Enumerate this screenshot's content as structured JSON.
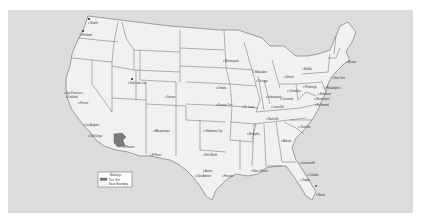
{
  "map": {
    "title": "",
    "colors": {
      "ocean": "#dcdcdc",
      "land": "#f1f1f1",
      "border": "#6a6a6a",
      "highlight": "#7a7a7a"
    },
    "cities": [
      {
        "name": "Seattle",
        "x": 90,
        "y": 24
      },
      {
        "name": "Portland",
        "x": 82,
        "y": 36
      },
      {
        "name": "San Francisco",
        "x": 66,
        "y": 94
      },
      {
        "name": "Oakland",
        "x": 68,
        "y": 98
      },
      {
        "name": "Fresno",
        "x": 80,
        "y": 104
      },
      {
        "name": "Salt Lake City",
        "x": 130,
        "y": 84
      },
      {
        "name": "Los Angeles",
        "x": 85,
        "y": 126
      },
      {
        "name": "San Diego",
        "x": 90,
        "y": 137
      },
      {
        "name": "Phoenix",
        "x": 125,
        "y": 148
      },
      {
        "name": "Denver",
        "x": 167,
        "y": 98
      },
      {
        "name": "Albuquerque",
        "x": 155,
        "y": 132
      },
      {
        "name": "El Paso",
        "x": 152,
        "y": 156
      },
      {
        "name": "Oklahoma City",
        "x": 205,
        "y": 132
      },
      {
        "name": "Fort Worth",
        "x": 205,
        "y": 156
      },
      {
        "name": "Austin",
        "x": 205,
        "y": 172
      },
      {
        "name": "San Antonio",
        "x": 197,
        "y": 177
      },
      {
        "name": "Omaha",
        "x": 218,
        "y": 89
      },
      {
        "name": "Kansas City",
        "x": 218,
        "y": 106
      },
      {
        "name": "Minneapolis",
        "x": 225,
        "y": 62
      },
      {
        "name": "Milwaukee",
        "x": 255,
        "y": 73
      },
      {
        "name": "Chicago",
        "x": 258,
        "y": 82
      },
      {
        "name": "St. Louis",
        "x": 244,
        "y": 108
      },
      {
        "name": "Memphis",
        "x": 249,
        "y": 135
      },
      {
        "name": "Detroit",
        "x": 286,
        "y": 78
      },
      {
        "name": "Indianapolis",
        "x": 268,
        "y": 98
      },
      {
        "name": "Columbus",
        "x": 289,
        "y": 92
      },
      {
        "name": "Cincinnati",
        "x": 282,
        "y": 100
      },
      {
        "name": "Louisville",
        "x": 273,
        "y": 108
      },
      {
        "name": "Nashville",
        "x": 268,
        "y": 120
      },
      {
        "name": "Pittsburgh",
        "x": 305,
        "y": 88
      },
      {
        "name": "Buffalo",
        "x": 304,
        "y": 70
      },
      {
        "name": "Boston",
        "x": 348,
        "y": 63
      },
      {
        "name": "New York",
        "x": 334,
        "y": 79
      },
      {
        "name": "Philadelphia",
        "x": 326,
        "y": 89
      },
      {
        "name": "Baltimore",
        "x": 320,
        "y": 95
      },
      {
        "name": "Washington",
        "x": 316,
        "y": 100
      },
      {
        "name": "Richmond",
        "x": 317,
        "y": 106
      },
      {
        "name": "Charlotte",
        "x": 300,
        "y": 128
      },
      {
        "name": "Atlanta",
        "x": 283,
        "y": 142
      },
      {
        "name": "Jacksonville",
        "x": 301,
        "y": 164
      },
      {
        "name": "New Orleans",
        "x": 253,
        "y": 172
      },
      {
        "name": "Houston",
        "x": 224,
        "y": 177
      },
      {
        "name": "Tampa",
        "x": 302,
        "y": 181
      },
      {
        "name": "Orlando",
        "x": 309,
        "y": 176
      },
      {
        "name": "Miami",
        "x": 318,
        "y": 196
      }
    ],
    "highlight_area": {
      "label": "Test Site",
      "x": 115,
      "y": 134,
      "w": 12,
      "h": 13
    },
    "legend": {
      "title": "Markings",
      "items": [
        {
          "label": "Test Site",
          "swatch": "#7a7a7a"
        },
        {
          "label": "Base Boundary",
          "swatch": "#cfcfcf"
        }
      ]
    }
  }
}
